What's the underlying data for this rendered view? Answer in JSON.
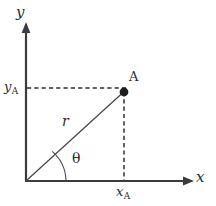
{
  "figure": {
    "background_color": "#ffffff",
    "axis_color": "#3b3b42",
    "line_color": "#46464e",
    "dash_color": "#2f2f35",
    "point_color": "#1d1d22",
    "width": 216,
    "height": 206
  },
  "axes": {
    "x_label": "x",
    "y_label": "x",
    "y_label_text": "y",
    "origin": {
      "x": 26,
      "y": 181
    },
    "x_axis_end": {
      "x": 193,
      "y": 181
    },
    "y_axis_end": {
      "x": 26,
      "y": 26
    }
  },
  "point": {
    "label": "A",
    "x": 124,
    "y": 92,
    "x_coordinate_label": "x",
    "x_coordinate_subscript": "A",
    "y_coordinate_label": "y",
    "y_coordinate_subscript": "A"
  },
  "polar": {
    "radius_label": "r",
    "angle_label": "θ",
    "arc_radius": 40
  },
  "guides": {
    "horizontal_dash_y": 88,
    "vertical_dash_x": 124
  }
}
